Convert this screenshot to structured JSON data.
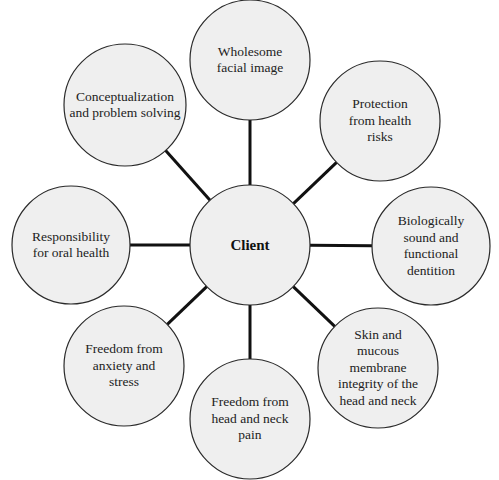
{
  "diagram": {
    "center": {
      "label": "Client",
      "cx": 250,
      "cy": 245,
      "r": 60
    },
    "nodes": [
      {
        "id": "wholesome-facial-image",
        "label": "Wholesome\nfacial image",
        "cx": 250,
        "cy": 60,
        "r": 60
      },
      {
        "id": "protection-from-health-risks",
        "label": "Protection\nfrom health\nrisks",
        "cx": 380,
        "cy": 121,
        "r": 60
      },
      {
        "id": "biologically-sound-dentition",
        "label": "Biologically\nsound and\nfunctional\ndentition",
        "cx": 431,
        "cy": 246,
        "r": 59
      },
      {
        "id": "skin-mucous-membrane-integrity",
        "label": "Skin and\nmucous\nmembrane\nintegrity of the\nhead and neck",
        "cx": 378,
        "cy": 368,
        "r": 60
      },
      {
        "id": "freedom-from-head-neck-pain",
        "label": "Freedom from\nhead and neck\npain",
        "cx": 250,
        "cy": 419,
        "r": 60
      },
      {
        "id": "freedom-from-anxiety-stress",
        "label": "Freedom from\nanxiety and\nstress",
        "cx": 124,
        "cy": 366,
        "r": 60
      },
      {
        "id": "responsibility-for-oral-health",
        "label": "Responsibility\nfor oral health",
        "cx": 71,
        "cy": 245,
        "r": 59
      },
      {
        "id": "conceptualization-problem-solving",
        "label": "Conceptualization\nand problem solving",
        "cx": 125,
        "cy": 105,
        "r": 61
      }
    ],
    "colors": {
      "node_fill": "#efefef",
      "node_stroke": "#2a2a2a",
      "connector": "#111111"
    }
  }
}
